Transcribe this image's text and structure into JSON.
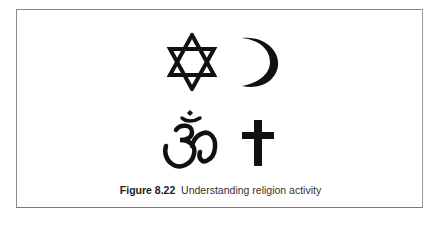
{
  "figure": {
    "symbols": [
      {
        "name": "star-of-david-icon",
        "religion": "Judaism"
      },
      {
        "name": "crescent-moon-icon",
        "religion": "Islam"
      },
      {
        "name": "om-icon",
        "religion": "Hinduism"
      },
      {
        "name": "cross-icon",
        "religion": "Christianity"
      }
    ],
    "caption_label": "Figure 8.22",
    "caption_text": "Understanding religion activity",
    "symbol_color": "#111111",
    "border_color": "#8a8a8a"
  }
}
